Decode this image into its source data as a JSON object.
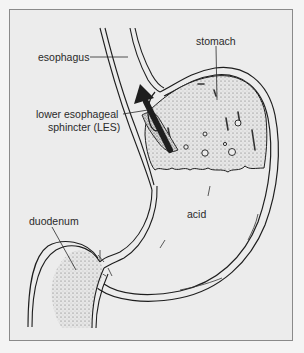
{
  "figure": {
    "type": "anatomical-illustration",
    "colors": {
      "background": "#ececec",
      "frame_border": "#8a8a8a",
      "outline": "#1e1e1e",
      "text": "#2a2a2a"
    }
  },
  "labels": {
    "esophagus": "esophagus",
    "les_line1": "lower esophageal",
    "les_line2": "sphincter (LES)",
    "stomach": "stomach",
    "duodenum": "duodenum",
    "acid": "acid"
  },
  "annotations": {
    "reflux_arrow": "arrow pointing upward from stomach into esophagus"
  }
}
